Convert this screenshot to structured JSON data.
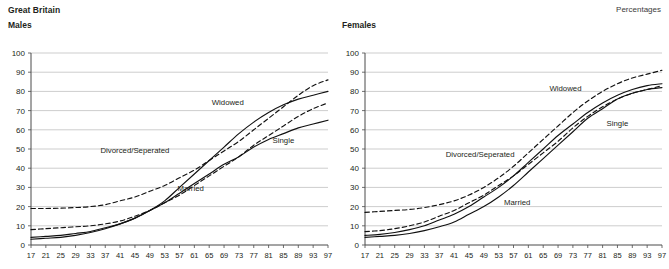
{
  "header": {
    "region_label": "Great Britain",
    "units_label": "Percentages"
  },
  "panels": [
    {
      "title": "Males"
    },
    {
      "title": "Females"
    }
  ],
  "chart_data": [
    {
      "type": "line",
      "title": "Males",
      "subtitle": "Great Britain",
      "xlabel": "",
      "ylabel": "Percentages",
      "grid": true,
      "legend": "inline-annotations",
      "xlim": [
        17,
        97
      ],
      "ylim": [
        0,
        100
      ],
      "yticks": [
        0,
        10,
        20,
        30,
        40,
        50,
        60,
        70,
        80,
        90,
        100
      ],
      "x": [
        17,
        21,
        25,
        29,
        33,
        37,
        41,
        45,
        49,
        53,
        57,
        61,
        65,
        69,
        73,
        77,
        81,
        85,
        89,
        93,
        97
      ],
      "series": [
        {
          "name": "Single",
          "style": "solid",
          "label_x": 85,
          "label_y": 53,
          "values": [
            4,
            4.5,
            5,
            6,
            7,
            9,
            11,
            14,
            18,
            22,
            27,
            32,
            37,
            42,
            46,
            51,
            55,
            58,
            61,
            63,
            65
          ]
        },
        {
          "name": "Married",
          "style": "solid",
          "label_x": 60,
          "label_y": 28,
          "values": [
            3,
            3.5,
            4,
            5,
            6.5,
            8.5,
            11,
            14,
            18,
            23,
            30,
            37,
            44,
            51,
            58,
            64,
            69,
            73,
            76,
            78,
            80
          ]
        },
        {
          "name": "Divorced/Seperated",
          "style": "dashed",
          "label_x": 45,
          "label_y": 48,
          "values": [
            8,
            8.5,
            9,
            9.5,
            10,
            11,
            12.5,
            15,
            18,
            22,
            26,
            31,
            36,
            41,
            46,
            52,
            57,
            62,
            67,
            71,
            74
          ]
        },
        {
          "name": "Widowed",
          "style": "dashed",
          "label_x": 70,
          "label_y": 73,
          "values": [
            19,
            19,
            19.2,
            19.5,
            20,
            21,
            23,
            25,
            28,
            31,
            35,
            39,
            44,
            49,
            54,
            60,
            66,
            72,
            78,
            83,
            86
          ]
        }
      ]
    },
    {
      "type": "line",
      "title": "Females",
      "subtitle": "Great Britain",
      "xlabel": "",
      "ylabel": "Percentages",
      "grid": true,
      "legend": "inline-annotations",
      "xlim": [
        17,
        97
      ],
      "ylim": [
        0,
        100
      ],
      "yticks": [
        0,
        10,
        20,
        30,
        40,
        50,
        60,
        70,
        80,
        90,
        100
      ],
      "x": [
        17,
        21,
        25,
        29,
        33,
        37,
        41,
        45,
        49,
        53,
        57,
        61,
        65,
        69,
        73,
        77,
        81,
        85,
        89,
        93,
        97
      ],
      "series": [
        {
          "name": "Single",
          "style": "solid",
          "label_x": 85,
          "label_y": 62,
          "values": [
            5,
            5.5,
            6.5,
            8,
            10,
            13,
            16,
            20,
            25,
            30,
            36,
            43,
            50,
            57,
            63,
            69,
            74,
            78,
            81,
            83,
            84
          ]
        },
        {
          "name": "Married",
          "style": "solid",
          "label_x": 58,
          "label_y": 21,
          "values": [
            4,
            4.5,
            5,
            6,
            7.5,
            9.5,
            12,
            16,
            20,
            25,
            31,
            38,
            45,
            52,
            59,
            66,
            71,
            76,
            79,
            81,
            82
          ]
        },
        {
          "name": "Divorced/Seperated",
          "style": "dashed",
          "label_x": 48,
          "label_y": 46,
          "values": [
            7,
            7.5,
            8.5,
            10,
            12,
            15,
            18,
            22,
            26,
            31,
            36,
            42,
            48,
            54,
            61,
            67,
            72,
            76,
            79,
            81,
            83
          ]
        },
        {
          "name": "Widowed",
          "style": "dashed",
          "label_x": 71,
          "label_y": 80,
          "values": [
            17,
            17.5,
            18,
            18.5,
            19.5,
            21,
            23,
            26,
            30,
            35,
            41,
            48,
            55,
            62,
            69,
            75,
            80,
            84,
            87,
            89,
            91
          ]
        }
      ]
    }
  ]
}
